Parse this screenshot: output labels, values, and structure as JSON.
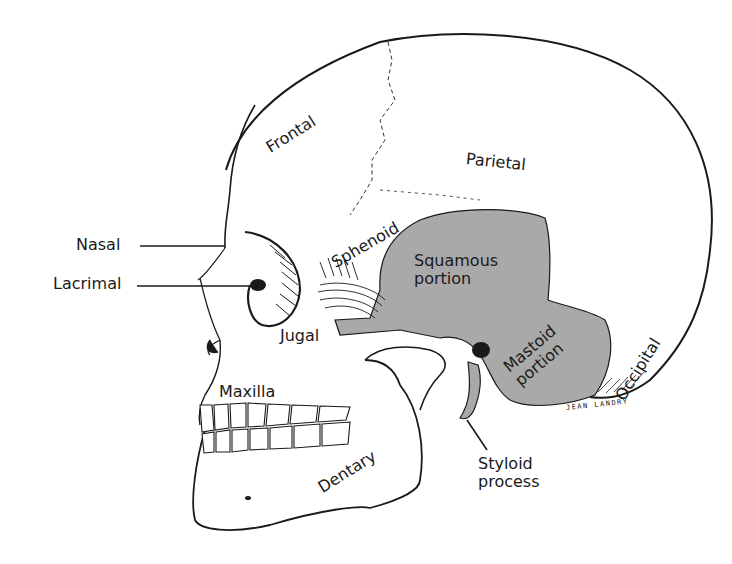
{
  "figure": {
    "colors": {
      "background": "#ffffff",
      "line": "#1a1a1a",
      "temporal_shade": "#a9a9a9",
      "bone": "#ffffff"
    },
    "labels": {
      "frontal": "Frontal",
      "parietal": "Parietal",
      "sphenoid": "Sphenoid",
      "squamous_portion": "Squamous\nportion",
      "nasal": "Nasal",
      "lacrimal": "Lacrimal",
      "jugal": "Jugal",
      "maxilla": "Maxilla",
      "mastoid_portion": "Mastoid\nportion",
      "occipital": "Occipital",
      "dentary": "Dentary",
      "styloid_process": "Styloid\nprocess"
    },
    "signature": "JEAN LANDRY"
  }
}
